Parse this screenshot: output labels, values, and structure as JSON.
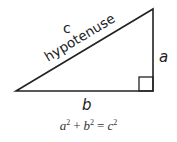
{
  "diagram": {
    "labels": {
      "hypotenuse_letter": "c",
      "hypotenuse_word": "hypotenuse",
      "vertical_side": "a",
      "horizontal_side": "b"
    },
    "formula": {
      "term1": "a",
      "exp1": "2",
      "plus": "+",
      "term2": "b",
      "exp2": "2",
      "equals": "=",
      "term3": "c",
      "exp3": "2"
    },
    "colors": {
      "line": "#222222",
      "text": "#222222"
    }
  }
}
